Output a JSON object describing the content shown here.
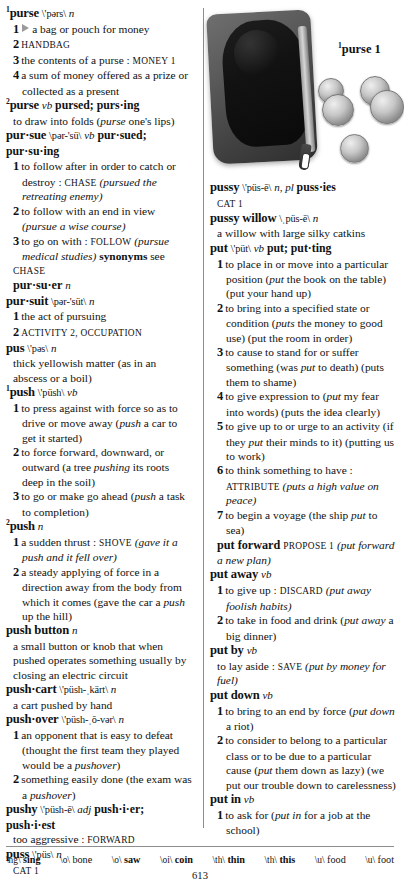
{
  "page": {
    "number": "613"
  },
  "illustration": {
    "caption_sup": "1",
    "caption_text": "purse 1",
    "alt": "black leather coin purse with zipper and silver coins"
  },
  "pronunciation_key": [
    {
      "symbol": "\\ng\\",
      "word": "sing"
    },
    {
      "symbol": "\\o\\",
      "word": "bone"
    },
    {
      "symbol": "\\o\\",
      "word": "saw"
    },
    {
      "symbol": "\\oi\\",
      "word": "coin"
    },
    {
      "symbol": "\\th\\",
      "word": "thin"
    },
    {
      "symbol": "\\th\\",
      "word": "this"
    },
    {
      "symbol": "\\u\\",
      "word": "food"
    },
    {
      "symbol": "\\u\\",
      "word": "foot"
    }
  ],
  "left_column": {
    "entries": [
      {
        "sup": "1",
        "headword": "purse",
        "pron": "\\'pərs\\",
        "pos": "n",
        "lines": [
          {
            "type": "sense",
            "num": "1",
            "arrow": true,
            "text": "a bag or pouch for money"
          },
          {
            "type": "sense",
            "num": "2",
            "smallcaps": "HANDBAG"
          },
          {
            "type": "sense",
            "num": "3",
            "text": "the contents of a purse :",
            "smallcaps_after": "MONEY 1"
          },
          {
            "type": "sense",
            "num": "4",
            "text": "a sum of money offered as a prize or collected as a present"
          }
        ]
      },
      {
        "sup": "2",
        "headword": "purse",
        "pron": "",
        "pos": "vb",
        "infl": "pursed; purs·ing",
        "lines": [
          {
            "type": "def",
            "text": "to draw into folds (",
            "italic": "purse",
            "text_after": " one's lips)"
          }
        ]
      },
      {
        "headword": "pur·sue",
        "pron": "\\pər-'sü\\",
        "pos": "vb",
        "infl": "pur·sued; pur·su·ing",
        "lines": [
          {
            "type": "sense",
            "num": "1",
            "text": "to follow after in order to catch or destroy :",
            "smallcaps_after": "CHASE",
            "paren": "(pursued the retreating enemy)"
          },
          {
            "type": "sense",
            "num": "2",
            "text": "to follow with an end in view",
            "paren": "(pursue a wise course)"
          },
          {
            "type": "sense",
            "num": "3",
            "text": "to go on with :",
            "smallcaps_after": "FOLLOW",
            "paren": "(pursue medical studies)",
            "bold_after": "synonyms",
            "tail": " see"
          },
          {
            "type": "xref",
            "smallcaps": "CHASE"
          },
          {
            "type": "runon",
            "text": "pur·su·er",
            "pos": "n"
          }
        ]
      },
      {
        "headword": "pur·suit",
        "pron": "\\pər-'süt\\",
        "pos": "n",
        "lines": [
          {
            "type": "sense",
            "num": "1",
            "text": "the act of pursuing"
          },
          {
            "type": "sense",
            "num": "2",
            "smallcaps": "ACTIVITY 2, OCCUPATION"
          }
        ]
      },
      {
        "headword": "pus",
        "pron": "\\'pəs\\",
        "pos": "n",
        "lines": [
          {
            "type": "def",
            "text": "thick yellowish matter (as in an abscess or a boil)"
          }
        ]
      },
      {
        "sup": "1",
        "headword": "push",
        "pron": "\\'püsh\\",
        "pos": "vb",
        "lines": [
          {
            "type": "sense",
            "num": "1",
            "text": "to press against with force so as to drive or move away (",
            "italic": "push",
            "text_after": " a car to get it started)"
          },
          {
            "type": "sense",
            "num": "2",
            "text": "to force forward, downward, or outward (a tree ",
            "italic": "pushing",
            "text_after": " its roots deep in the soil)"
          },
          {
            "type": "sense",
            "num": "3",
            "text": "to go or make go ahead (",
            "italic": "push",
            "text_after": " a task to completion)"
          }
        ]
      },
      {
        "sup": "2",
        "headword": "push",
        "pron": "",
        "pos": "n",
        "lines": [
          {
            "type": "sense",
            "num": "1",
            "text": "a sudden thrust :",
            "smallcaps_after": "SHOVE",
            "paren": "(gave it a push and it fell over)"
          },
          {
            "type": "sense",
            "num": "2",
            "text": "a steady applying of force in a direction away from the body from which it comes (gave the car a ",
            "italic": "push",
            "text_after": " up the hill)"
          }
        ]
      },
      {
        "headword": "push button",
        "pron": "",
        "pos": "n",
        "lines": [
          {
            "type": "def",
            "text": "a small button or knob that when pushed operates something usually by closing an electric circuit"
          }
        ]
      },
      {
        "headword": "push·cart",
        "pron": "\\'püsh-ˌkärt\\",
        "pos": "n",
        "lines": [
          {
            "type": "def",
            "text": "a cart pushed by hand"
          }
        ]
      },
      {
        "headword": "push·over",
        "pron": "\\'püsh-ˌō-vər\\",
        "pos": "n",
        "lines": [
          {
            "type": "sense",
            "num": "1",
            "text": "an opponent that is easy to defeat (thought the first team they played would be a ",
            "italic": "pushover",
            "text_after": ")"
          },
          {
            "type": "sense",
            "num": "2",
            "text": "something easily done (the exam was a ",
            "italic": "pushover",
            "text_after": ")"
          }
        ]
      },
      {
        "headword": "pushy",
        "pron": "\\'püsh-ē\\",
        "pos": "adj",
        "infl": "push·i·er; push·i·est",
        "lines": [
          {
            "type": "def",
            "text": "too aggressive :",
            "smallcaps_after": "FORWARD"
          }
        ]
      },
      {
        "headword": "puss",
        "pron": "\\'püs\\",
        "pos": "n",
        "lines": [
          {
            "type": "xref",
            "smallcaps": "CAT 1"
          }
        ]
      }
    ]
  },
  "right_column": {
    "entries": [
      {
        "headword": "pussy",
        "pron": "\\'püs-ē\\",
        "pos": "n, pl",
        "infl": "puss·ies",
        "lines": [
          {
            "type": "xref",
            "smallcaps": "CAT 1"
          }
        ]
      },
      {
        "headword": "pussy willow",
        "pron": "\\ˌpüs-ē\\",
        "pos": "n",
        "lines": [
          {
            "type": "def",
            "text": "a willow with large silky catkins"
          }
        ]
      },
      {
        "headword": "put",
        "pron": "\\'püt\\",
        "pos": "vb",
        "infl": "put; put·ting",
        "lines": [
          {
            "type": "sense",
            "num": "1",
            "text": "to place in or move into a particular position (",
            "italic": "put",
            "text_after": " the book on the table) (put your hand up)"
          },
          {
            "type": "sense",
            "num": "2",
            "text": "to bring into a specified state or condition (",
            "italic": "puts",
            "text_after": " the money to good use) (put the room in order)"
          },
          {
            "type": "sense",
            "num": "3",
            "text": "to cause to stand for or suffer something (was ",
            "italic": "put",
            "text_after": " to death) (puts them to shame)"
          },
          {
            "type": "sense",
            "num": "4",
            "text": "to give expression to (",
            "italic": "put",
            "text_after": " my fear into words) (puts the idea clearly)"
          },
          {
            "type": "sense",
            "num": "5",
            "text": "to give up to or urge to an activity (if they ",
            "italic": "put",
            "text_after": " their minds to it) (putting us to work)"
          },
          {
            "type": "sense",
            "num": "6",
            "text": "to think something to have :",
            "smallcaps_after": "ATTRIBUTE",
            "paren": "(puts a high value on peace)"
          },
          {
            "type": "sense",
            "num": "7",
            "text": "to begin a voyage (the ship ",
            "italic": "put",
            "text_after": " to sea)"
          }
        ]
      },
      {
        "headword": "put forward",
        "pron": "",
        "pos": "",
        "lines": [
          {
            "type": "def-inline",
            "smallcaps": "PROPOSE 1",
            "paren": "(put forward a new plan)"
          }
        ]
      },
      {
        "headword": "put away",
        "pron": "",
        "pos": "vb",
        "lines": [
          {
            "type": "sense",
            "num": "1",
            "text": "to give up :",
            "smallcaps_after": "DISCARD",
            "paren": "(put away foolish habits)"
          },
          {
            "type": "sense",
            "num": "2",
            "text": "to take in food and drink (",
            "italic": "put away",
            "text_after": " a big dinner)"
          }
        ]
      },
      {
        "headword": "put by",
        "pron": "",
        "pos": "vb",
        "lines": [
          {
            "type": "def",
            "text": "to lay aside :",
            "smallcaps_after": "SAVE",
            "paren": "(put by money for fuel)"
          }
        ]
      },
      {
        "headword": "put down",
        "pron": "",
        "pos": "vb",
        "lines": [
          {
            "type": "sense",
            "num": "1",
            "text": "to bring to an end by force (",
            "italic": "put down",
            "text_after": " a riot)"
          },
          {
            "type": "sense",
            "num": "2",
            "text": "to consider to belong to a particular class or to be due to a particular cause (",
            "italic": "put",
            "text_after": " them down as lazy) (we put our trouble down to carelessness)"
          }
        ]
      },
      {
        "headword": "put in",
        "pron": "",
        "pos": "vb",
        "lines": [
          {
            "type": "sense",
            "num": "1",
            "text": "to ask for (",
            "italic": "put in",
            "text_after": " for a job at the school)"
          }
        ]
      }
    ]
  }
}
